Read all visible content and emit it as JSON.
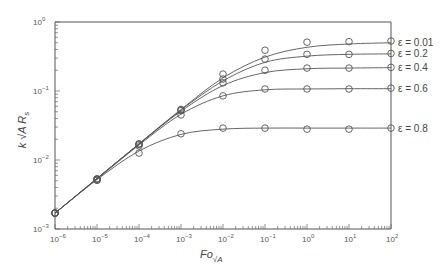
{
  "chart_data": {
    "type": "line",
    "title": "",
    "xlabel": "Fo_√A",
    "ylabel": "k √A R_s",
    "xscale": "log",
    "yscale": "log",
    "xlim": [
      1e-06,
      100
    ],
    "ylim": [
      0.001,
      1
    ],
    "grid": false,
    "legend_position": "right, inline labels at curve ends",
    "x_tick_labels": [
      "10^-6",
      "10^-5",
      "10^-4",
      "10^-3",
      "10^-2",
      "10^-1",
      "10^0",
      "10^1",
      "10^2"
    ],
    "y_tick_labels": [
      "10^-3",
      "10^-2",
      "10^-1",
      "10^0"
    ],
    "x": [
      1e-06,
      1e-05,
      0.0001,
      0.001,
      0.01,
      0.1,
      1,
      10,
      100
    ],
    "series": [
      {
        "name": "ε = 0.01",
        "label": "ε = 0.01",
        "markers": [
          0.0017,
          0.0053,
          0.017,
          0.054,
          0.176,
          0.39,
          0.51,
          0.52,
          0.53
        ],
        "curve": [
          0.0017,
          0.0054,
          0.0172,
          0.054,
          0.155,
          0.31,
          0.43,
          0.48,
          0.5
        ]
      },
      {
        "name": "ε = 0.2",
        "label": "ε = 0.2",
        "markers": [
          0.0017,
          0.0053,
          0.017,
          0.053,
          0.149,
          0.29,
          0.34,
          0.34,
          0.35
        ],
        "curve": [
          0.0017,
          0.0054,
          0.0171,
          0.053,
          0.14,
          0.26,
          0.32,
          0.34,
          0.345
        ]
      },
      {
        "name": "ε = 0.4",
        "label": "ε = 0.4",
        "markers": [
          0.0017,
          0.0053,
          0.017,
          0.052,
          0.131,
          0.2,
          0.215,
          0.215,
          0.22
        ],
        "curve": [
          0.0017,
          0.0054,
          0.017,
          0.051,
          0.12,
          0.185,
          0.21,
          0.215,
          0.218
        ]
      },
      {
        "name": "ε = 0.6",
        "label": "ε = 0.6",
        "markers": [
          0.0017,
          0.0051,
          0.016,
          0.045,
          0.085,
          0.107,
          0.107,
          0.107,
          0.11
        ],
        "curve": [
          0.0017,
          0.0053,
          0.0165,
          0.046,
          0.085,
          0.104,
          0.107,
          0.108,
          0.108
        ]
      },
      {
        "name": "ε = 0.8",
        "label": "ε = 0.8",
        "markers": [
          0.0017,
          0.0051,
          0.0126,
          0.024,
          0.029,
          0.029,
          0.028,
          0.028,
          0.029
        ],
        "curve": [
          0.0017,
          0.0052,
          0.0135,
          0.0235,
          0.028,
          0.029,
          0.029,
          0.029,
          0.029
        ]
      }
    ]
  },
  "labels": {
    "xlabel_main": "Fo",
    "xlabel_sub": "√A",
    "ylabel_k": "k",
    "ylabel_sqrt": "√A",
    "ylabel_R": "R",
    "ylabel_sub": "s"
  }
}
